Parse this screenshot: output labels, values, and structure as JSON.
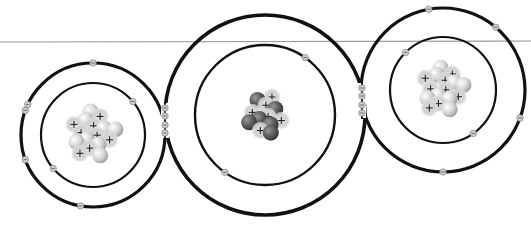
{
  "diagram": {
    "colors": {
      "background": "#ffffff",
      "baseline": "#9a9a9a",
      "orbit": "#111111",
      "electron_fill": "#cfcfcf",
      "electron_stroke": "#8a8a8a",
      "proton_fill": "#c8c8c8",
      "neutron_light_fill": "#e2e2e2",
      "neutron_dark_fill": "#5a5a5a",
      "plus_sign": "#222222"
    },
    "atoms": [
      {
        "id": "left-oxygen",
        "role": "outer atom",
        "shells": [
          {
            "name": "inner-shell",
            "electrons": 2
          },
          {
            "name": "outer-shell",
            "electrons": 6,
            "shared_with_center": 2
          }
        ],
        "nucleus": {
          "protons": 8,
          "neutrons": 8,
          "neutron_style": "light",
          "proton_symbol": "+"
        }
      },
      {
        "id": "center-carbon",
        "role": "central atom",
        "shells": [
          {
            "name": "inner-shell",
            "electrons": 2
          },
          {
            "name": "outer-shell",
            "electrons": 4,
            "shared_with_left": 2,
            "shared_with_right": 2
          }
        ],
        "nucleus": {
          "protons": 6,
          "neutrons": 6,
          "neutron_style": "dark",
          "proton_symbol": "+"
        }
      },
      {
        "id": "right-oxygen",
        "role": "outer atom",
        "shells": [
          {
            "name": "inner-shell",
            "electrons": 2
          },
          {
            "name": "outer-shell",
            "electrons": 6,
            "shared_with_center": 2
          }
        ],
        "nucleus": {
          "protons": 8,
          "neutrons": 8,
          "neutron_style": "light",
          "proton_symbol": "+"
        }
      }
    ],
    "bonds": [
      {
        "between": [
          "left-oxygen",
          "center-carbon"
        ],
        "shared_electrons": 4,
        "type": "double"
      },
      {
        "between": [
          "center-carbon",
          "right-oxygen"
        ],
        "shared_electrons": 4,
        "type": "double"
      }
    ]
  }
}
